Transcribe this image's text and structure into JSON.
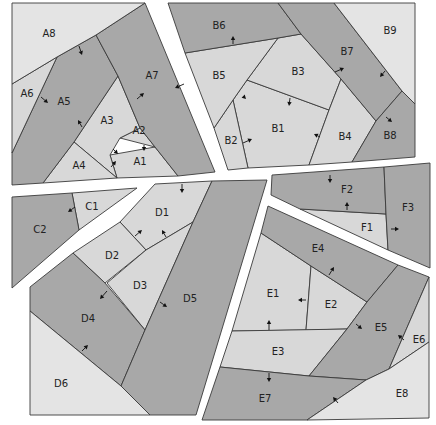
{
  "colors": {
    "light": "#d8d8d8",
    "lighter": "#e4e4e4",
    "dark": "#a8a8a8",
    "stroke": "#3a3a3a",
    "background": "#ffffff"
  },
  "sections": [
    {
      "id": "A",
      "pieces": [
        {
          "id": "A1",
          "label": "A1",
          "shade": "light",
          "points": "110,155 155,147 178,176 117,178",
          "lx": 140,
          "ly": 162
        },
        {
          "id": "A2",
          "label": "A2",
          "shade": "light",
          "points": "140,128 155,147 120,138",
          "lx": 139,
          "ly": 131
        },
        {
          "id": "A3",
          "label": "A3",
          "shade": "light",
          "points": "118,76 140,128 120,138 110,155 117,178 74,142",
          "lx": 107,
          "ly": 121
        },
        {
          "id": "A4",
          "label": "A4",
          "shade": "light",
          "points": "74,142 117,178 43,183",
          "lx": 79,
          "ly": 166
        },
        {
          "id": "A5",
          "label": "A5",
          "shade": "dark",
          "points": "57,57 96,35 118,76 74,142 43,183 12,185 12,153",
          "lx": 64,
          "ly": 102
        },
        {
          "id": "A6",
          "label": "A6",
          "shade": "light",
          "points": "12,84 57,57 12,153",
          "lx": 27,
          "ly": 94
        },
        {
          "id": "A7",
          "label": "A7",
          "shade": "dark",
          "points": "96,35 145,3 215,172 178,176 155,147 140,128 118,76",
          "lx": 152,
          "ly": 76
        },
        {
          "id": "A8",
          "label": "A8",
          "shade": "lighter",
          "points": "12,3 145,3 96,35 57,57 12,84",
          "lx": 49,
          "ly": 34
        }
      ]
    },
    {
      "id": "B",
      "pieces": [
        {
          "id": "B1",
          "label": "B1",
          "shade": "light",
          "points": "247,80 329,110 309,165 248,168 233,100",
          "lx": 278,
          "ly": 129
        },
        {
          "id": "B2",
          "label": "B2",
          "shade": "light",
          "points": "233,100 248,168 228,170 214,128",
          "lx": 231,
          "ly": 141
        },
        {
          "id": "B3",
          "label": "B3",
          "shade": "light",
          "points": "278,38 301,34 341,79 329,110 247,80",
          "lx": 298,
          "ly": 72
        },
        {
          "id": "B4",
          "label": "B4",
          "shade": "light",
          "points": "341,79 376,121 352,162 309,165 329,110",
          "lx": 345,
          "ly": 137
        },
        {
          "id": "B5",
          "label": "B5",
          "shade": "light",
          "points": "185,53 278,38 247,80 233,100 214,128",
          "lx": 219,
          "ly": 76
        },
        {
          "id": "B6",
          "label": "B6",
          "shade": "dark",
          "points": "168,3 278,3 301,34 278,38 185,53",
          "lx": 219,
          "ly": 26
        },
        {
          "id": "B7",
          "label": "B7",
          "shade": "dark",
          "points": "278,3 334,3 402,91 376,121 341,79 301,34",
          "lx": 347,
          "ly": 52
        },
        {
          "id": "B8",
          "label": "B8",
          "shade": "dark",
          "points": "402,91 415,104 415,157 352,162 376,121",
          "lx": 390,
          "ly": 136
        },
        {
          "id": "B9",
          "label": "B9",
          "shade": "lighter",
          "points": "334,3 415,3 415,104 402,91",
          "lx": 390,
          "ly": 31
        }
      ]
    },
    {
      "id": "C",
      "pieces": [
        {
          "id": "C1",
          "label": "C1",
          "shade": "light",
          "points": "72,193 137,188 79,230",
          "lx": 92,
          "ly": 207
        },
        {
          "id": "C2",
          "label": "C2",
          "shade": "dark",
          "points": "12,197 72,193 79,230 12,288",
          "lx": 40,
          "ly": 230
        }
      ]
    },
    {
      "id": "D",
      "pieces": [
        {
          "id": "D1",
          "label": "D1",
          "shade": "light",
          "points": "155,184 212,181 193,222 146,250 120,222",
          "lx": 162,
          "ly": 213
        },
        {
          "id": "D2",
          "label": "D2",
          "shade": "light",
          "points": "120,222 146,250 105,283 73,253",
          "lx": 112,
          "ly": 256
        },
        {
          "id": "D3",
          "label": "D3",
          "shade": "light",
          "points": "146,250 193,222 145,330 107,283",
          "lx": 140,
          "ly": 286
        },
        {
          "id": "D4",
          "label": "D4",
          "shade": "dark",
          "points": "73,253 105,283 145,330 121,386 30,311 30,287",
          "lx": 88,
          "ly": 319
        },
        {
          "id": "D5",
          "label": "D5",
          "shade": "dark",
          "points": "212,181 267,180 196,415 150,415 121,386 145,330 193,222",
          "lx": 190,
          "ly": 299
        },
        {
          "id": "D6",
          "label": "D6",
          "shade": "lighter",
          "points": "30,311 121,386 150,415 30,415",
          "lx": 61,
          "ly": 384
        }
      ]
    },
    {
      "id": "E",
      "pieces": [
        {
          "id": "E1",
          "label": "E1",
          "shade": "light",
          "points": "261,233 311,266 306,330 232,331",
          "lx": 273,
          "ly": 294
        },
        {
          "id": "E2",
          "label": "E2",
          "shade": "light",
          "points": "311,266 367,302 347,329 306,330",
          "lx": 331,
          "ly": 305
        },
        {
          "id": "E3",
          "label": "E3",
          "shade": "light",
          "points": "232,331 347,329 309,376 220,367",
          "lx": 278,
          "ly": 352
        },
        {
          "id": "E4",
          "label": "E4",
          "shade": "dark",
          "points": "268,206 398,265 367,302 311,266 261,233",
          "lx": 318,
          "ly": 249
        },
        {
          "id": "E5",
          "label": "E5",
          "shade": "dark",
          "points": "398,265 429,277 389,369 366,380 309,376 347,329 367,302",
          "lx": 381,
          "ly": 328
        },
        {
          "id": "E6",
          "label": "E6",
          "shade": "light",
          "points": "429,277 429,342 389,369",
          "lx": 419,
          "ly": 340
        },
        {
          "id": "E7",
          "label": "E7",
          "shade": "dark",
          "points": "220,367 309,376 366,380 307,420 202,420",
          "lx": 265,
          "ly": 399
        },
        {
          "id": "E8",
          "label": "E8",
          "shade": "lighter",
          "points": "366,380 389,369 429,342 429,418 307,420",
          "lx": 402,
          "ly": 394
        }
      ]
    },
    {
      "id": "F",
      "pieces": [
        {
          "id": "F1",
          "label": "F1",
          "shade": "light",
          "points": "300,209 386,214 388,250",
          "lx": 367,
          "ly": 228
        },
        {
          "id": "F2",
          "label": "F2",
          "shade": "dark",
          "points": "272,175 384,167 386,214 300,209 271,195",
          "lx": 347,
          "ly": 190
        },
        {
          "id": "F3",
          "label": "F3",
          "shade": "dark",
          "points": "384,167 430,163 430,268 388,250 386,214",
          "lx": 408,
          "ly": 208
        }
      ]
    }
  ],
  "arrows": [
    {
      "id": "a-A8-A5",
      "x1": 79,
      "y1": 46,
      "x2": 82,
      "y2": 55
    },
    {
      "id": "a-A6-A5",
      "x1": 41,
      "y1": 97,
      "x2": 48,
      "y2": 103
    },
    {
      "id": "a-A5",
      "x1": 82,
      "y1": 127,
      "x2": 78,
      "y2": 120
    },
    {
      "id": "a-A7",
      "x1": 137,
      "y1": 99,
      "x2": 144,
      "y2": 93
    },
    {
      "id": "a-A7b",
      "x1": 184,
      "y1": 84,
      "x2": 175,
      "y2": 88
    },
    {
      "id": "a-A2",
      "x1": 144,
      "y1": 145,
      "x2": 144,
      "y2": 151
    },
    {
      "id": "a-A3",
      "x1": 113,
      "y1": 149,
      "x2": 118,
      "y2": 154
    },
    {
      "id": "a-A4",
      "x1": 111,
      "y1": 167,
      "x2": 116,
      "y2": 161
    },
    {
      "id": "a-B6",
      "x1": 233,
      "y1": 44,
      "x2": 233,
      "y2": 36
    },
    {
      "id": "a-B5",
      "x1": 243,
      "y1": 96,
      "x2": 246,
      "y2": 99
    },
    {
      "id": "a-B3",
      "x1": 290,
      "y1": 98,
      "x2": 289,
      "y2": 106
    },
    {
      "id": "a-B7",
      "x1": 335,
      "y1": 72,
      "x2": 344,
      "y2": 68
    },
    {
      "id": "a-B7b",
      "x1": 385,
      "y1": 71,
      "x2": 380,
      "y2": 77
    },
    {
      "id": "a-B4",
      "x1": 320,
      "y1": 137,
      "x2": 314,
      "y2": 134
    },
    {
      "id": "a-B2",
      "x1": 243,
      "y1": 143,
      "x2": 252,
      "y2": 139
    },
    {
      "id": "a-B8",
      "x1": 386,
      "y1": 117,
      "x2": 392,
      "y2": 122
    },
    {
      "id": "a-C2",
      "x1": 75,
      "y1": 207,
      "x2": 68,
      "y2": 212
    },
    {
      "id": "a-D1",
      "x1": 182,
      "y1": 184,
      "x2": 182,
      "y2": 193
    },
    {
      "id": "a-D2",
      "x1": 135,
      "y1": 236,
      "x2": 142,
      "y2": 230
    },
    {
      "id": "a-D1b",
      "x1": 166,
      "y1": 237,
      "x2": 162,
      "y2": 230
    },
    {
      "id": "a-D4",
      "x1": 107,
      "y1": 291,
      "x2": 100,
      "y2": 299
    },
    {
      "id": "a-D5",
      "x1": 160,
      "y1": 302,
      "x2": 167,
      "y2": 307
    },
    {
      "id": "a-D6",
      "x1": 82,
      "y1": 351,
      "x2": 88,
      "y2": 345
    },
    {
      "id": "a-F2",
      "x1": 330,
      "y1": 175,
      "x2": 330,
      "y2": 183
    },
    {
      "id": "a-F2b",
      "x1": 347,
      "y1": 210,
      "x2": 347,
      "y2": 202
    },
    {
      "id": "a-F3",
      "x1": 391,
      "y1": 229,
      "x2": 399,
      "y2": 229
    },
    {
      "id": "a-E4",
      "x1": 329,
      "y1": 275,
      "x2": 334,
      "y2": 267
    },
    {
      "id": "a-E1",
      "x1": 306,
      "y1": 300,
      "x2": 298,
      "y2": 300
    },
    {
      "id": "a-E1b",
      "x1": 269,
      "y1": 330,
      "x2": 269,
      "y2": 320
    },
    {
      "id": "a-E5",
      "x1": 356,
      "y1": 324,
      "x2": 362,
      "y2": 329
    },
    {
      "id": "a-E6",
      "x1": 404,
      "y1": 340,
      "x2": 398,
      "y2": 335
    },
    {
      "id": "a-E7",
      "x1": 269,
      "y1": 373,
      "x2": 269,
      "y2": 382
    },
    {
      "id": "a-E8",
      "x1": 338,
      "y1": 403,
      "x2": 333,
      "y2": 397
    }
  ]
}
